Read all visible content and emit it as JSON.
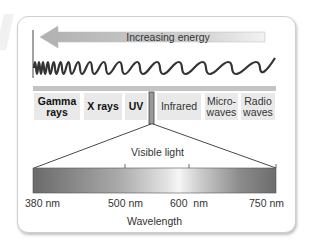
{
  "diagram": {
    "arrow_label": "Increasing energy",
    "categories": [
      {
        "line1": "Gamma",
        "line2": "rays",
        "bold": true
      },
      {
        "line1": "X rays",
        "line2": "",
        "bold": true
      },
      {
        "line1": "UV",
        "line2": "",
        "bold": true
      },
      {
        "line1": "Infrared",
        "line2": "",
        "bold": false
      },
      {
        "line1": "Micro-",
        "line2": "waves",
        "bold": false
      },
      {
        "line1": "Radio",
        "line2": "waves",
        "bold": false
      }
    ],
    "visible_label": "Visible light",
    "tick_labels": [
      "380 nm",
      "500 nm",
      "600  nm",
      "750 nm"
    ],
    "axis_label": "Wavelength",
    "colors": {
      "arrow": "#bdbdbd",
      "wave": "#333333",
      "bar": "#c4c4c4",
      "category_bg": "#e9e9e9",
      "spectrum_dark": "#6e6e6e",
      "spectrum_light": "#f4f4f4"
    }
  }
}
